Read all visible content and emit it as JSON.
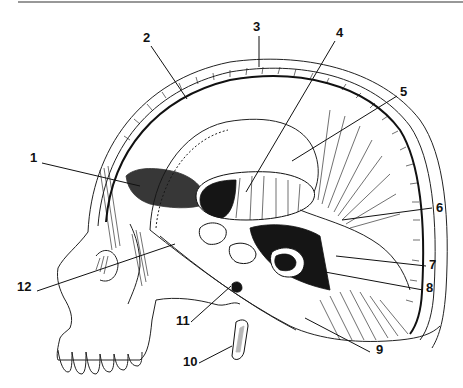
{
  "figure": {
    "title": "",
    "top_rule": true,
    "callouts": [
      {
        "n": "1",
        "label_x": 30,
        "label_y": 162,
        "line": [
          42,
          163,
          140,
          186
        ]
      },
      {
        "n": "2",
        "label_x": 143,
        "label_y": 42,
        "line": [
          151,
          46,
          187,
          99
        ]
      },
      {
        "n": "3",
        "label_x": 253,
        "label_y": 31,
        "line": [
          259,
          36,
          259,
          67
        ]
      },
      {
        "n": "4",
        "label_x": 336,
        "label_y": 37,
        "line": [
          335,
          41,
          246,
          192
        ]
      },
      {
        "n": "5",
        "label_x": 400,
        "label_y": 96,
        "line": [
          397,
          96,
          292,
          161
        ]
      },
      {
        "n": "6",
        "label_x": 436,
        "label_y": 212,
        "line": [
          432,
          208,
          342,
          220
        ]
      },
      {
        "n": "7",
        "label_x": 429,
        "label_y": 269,
        "line": [
          426,
          266,
          336,
          256
        ]
      },
      {
        "n": "8",
        "label_x": 426,
        "label_y": 292,
        "line": [
          423,
          290,
          325,
          272
        ]
      },
      {
        "n": "9",
        "label_x": 376,
        "label_y": 354,
        "line": [
          370,
          352,
          305,
          318
        ]
      },
      {
        "n": "10",
        "label_x": 183,
        "label_y": 366,
        "line": [
          199,
          363,
          232,
          346
        ]
      },
      {
        "n": "11",
        "label_x": 176,
        "label_y": 325,
        "line": [
          191,
          322,
          231,
          286
        ]
      },
      {
        "n": "12",
        "label_x": 17,
        "label_y": 291,
        "line": [
          37,
          291,
          175,
          244
        ]
      }
    ]
  }
}
